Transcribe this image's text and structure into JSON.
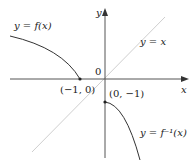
{
  "diagram": {
    "type": "function-and-inverse-graph",
    "axes": {
      "x_label": "x",
      "y_label": "y",
      "origin_label": "0"
    },
    "curves": [
      {
        "id": "f",
        "label": "y = f(x)",
        "color": "#333333"
      },
      {
        "id": "f_inverse",
        "label": "y = f⁻¹(x)",
        "color": "#333333"
      },
      {
        "id": "identity",
        "label": "y = x",
        "color": "#c8c8c8"
      }
    ],
    "points": [
      {
        "label": "(−1, 0)",
        "x": -1,
        "y": 0
      },
      {
        "label": "(0, −1)",
        "x": 0,
        "y": -1
      }
    ]
  }
}
